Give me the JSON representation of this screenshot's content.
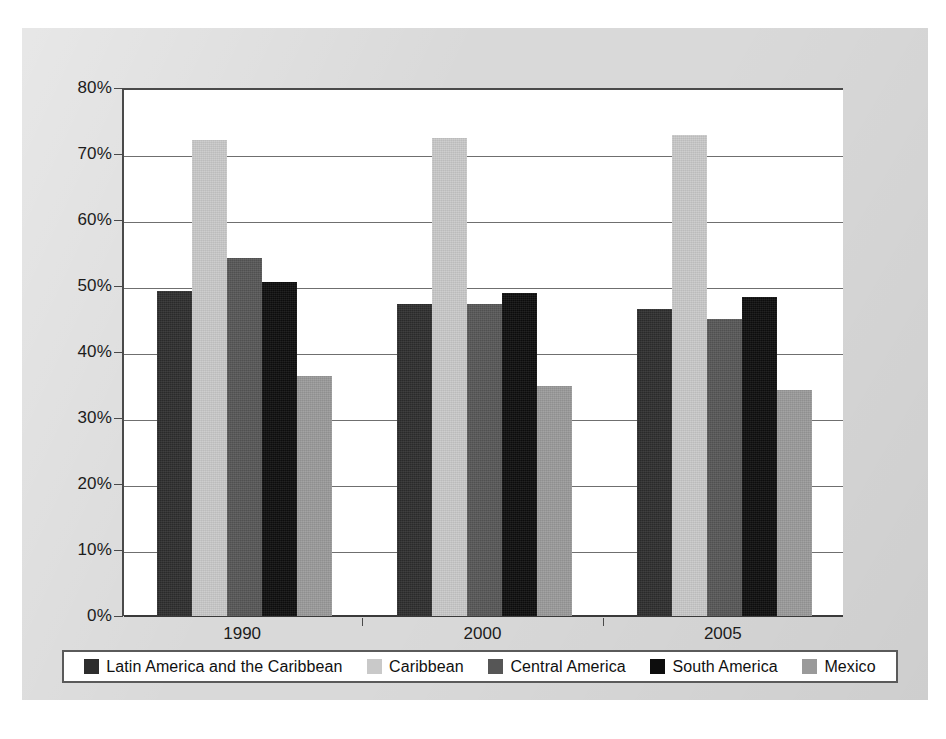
{
  "chart_data": {
    "type": "bar",
    "title": "",
    "subtitle": "",
    "xlabel": "",
    "ylabel": "",
    "categories": [
      "1990",
      "2000",
      "2005"
    ],
    "series": [
      {
        "name": "Latin America and the Caribbean",
        "color": "#2d2d2d",
        "values": [
          49.2,
          47.2,
          46.5
        ]
      },
      {
        "name": "Caribbean",
        "color": "#c9c9c9",
        "values": [
          72.1,
          72.5,
          72.9
        ]
      },
      {
        "name": "Central America",
        "color": "#565656",
        "values": [
          54.3,
          47.2,
          45.0
        ]
      },
      {
        "name": "South America",
        "color": "#0d0d0d",
        "values": [
          50.6,
          49.0,
          48.3
        ]
      },
      {
        "name": "Mexico",
        "color": "#9a9a9a",
        "values": [
          36.3,
          34.8,
          34.2
        ]
      }
    ],
    "ylim": [
      0,
      80
    ],
    "ytick_step": 10,
    "ytick_labels": [
      "0%",
      "10%",
      "20%",
      "30%",
      "40%",
      "50%",
      "60%",
      "70%",
      "80%"
    ],
    "ytick_values": [
      0,
      10,
      20,
      30,
      40,
      50,
      60,
      70,
      80
    ],
    "grid": true,
    "grid_axis": "y",
    "legend_position": "bottom",
    "value_suffix": "%"
  },
  "colors": {
    "page_background": "#ffffff",
    "panel_background": "#d9d9d9",
    "plot_background": "#ffffff",
    "gridline": "#6f6f6f",
    "axis": "#4a4a4a",
    "text": "#1c1c1c",
    "legend_border": "#5a5a5a"
  }
}
